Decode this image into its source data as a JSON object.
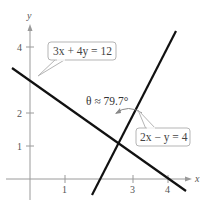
{
  "figure": {
    "axes": {
      "x_label": "x",
      "y_label": "y",
      "x_ticks": [
        {
          "value": 1,
          "label": "1"
        },
        {
          "value": 3,
          "label": "3"
        },
        {
          "value": 4,
          "label": "4"
        }
      ],
      "y_ticks": [
        {
          "value": 1,
          "label": "1"
        },
        {
          "value": 2,
          "label": "2"
        },
        {
          "value": 4,
          "label": "4"
        }
      ]
    },
    "lines": [
      {
        "equation": "3x + 4y = 12",
        "color": "#111111"
      },
      {
        "equation": "2x − y = 4",
        "color": "#111111"
      }
    ],
    "angle_annotation": "θ ≈ 79.7°"
  }
}
